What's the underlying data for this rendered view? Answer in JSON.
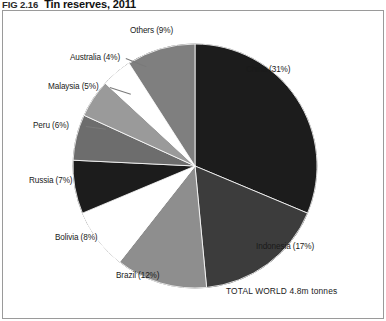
{
  "figure": {
    "number": "FIG 2.16",
    "title": "Tin reserves, 2011"
  },
  "total_label": "TOTAL WORLD 4.8m tonnes",
  "chart_data": {
    "type": "pie",
    "title": "Tin reserves, 2011",
    "subtitle": "",
    "xlabel": "",
    "ylabel": "",
    "unit": "percent of world reserves",
    "total": "4.8m tonnes",
    "legend_position": "none",
    "labels_inline": true,
    "start_angle_deg": 0,
    "direction": "clockwise",
    "categories": [
      "China",
      "Indonesia",
      "Brazil",
      "Bolivia",
      "Russia",
      "Peru",
      "Malaysia",
      "Australia",
      "Others"
    ],
    "values": [
      31,
      17,
      12,
      8,
      7,
      6,
      5,
      4,
      9
    ],
    "slice_labels": [
      "China (31%)",
      "Indonesia (17%)",
      "Brazil (12%)",
      "Bolivia (8%)",
      "Russia (7%)",
      "Peru (6%)",
      "Malaysia (5%)",
      "Australia (4%)",
      "Others (9%)"
    ],
    "colors": [
      "#1c1c1c",
      "#3c3c3c",
      "#8e8e8e",
      "#ffffff",
      "#1c1c1c",
      "#6d6d6d",
      "#9a9a9a",
      "#ffffff",
      "#7f7f7f"
    ]
  }
}
